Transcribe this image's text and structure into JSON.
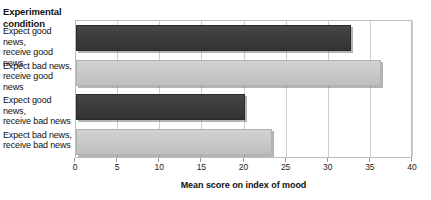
{
  "axis_group_title": "Experimental\ncondition",
  "chart_data": {
    "type": "bar",
    "orientation": "horizontal",
    "title": "",
    "subtitle": "",
    "xlabel": "Mean score on index of mood",
    "ylabel": "Experimental condition",
    "xlim": [
      0,
      40
    ],
    "xticks": [
      0,
      5,
      10,
      15,
      20,
      25,
      30,
      35,
      40
    ],
    "xtick_labels": [
      "0",
      "5",
      "10",
      "15",
      "20",
      "25",
      "30",
      "35",
      "40"
    ],
    "grid": "vertical",
    "legend": "none",
    "categories": [
      "Expect good news, receive good news",
      "Expect bad news, receive good news",
      "Expect good news, receive bad news",
      "Expect bad news, receive bad news"
    ],
    "category_lines": [
      [
        "Expect good news,",
        "receive good news"
      ],
      [
        "Expect bad news,",
        "receive good news"
      ],
      [
        "Expect good news,",
        "receive bad news"
      ],
      [
        "Expect bad news,",
        "receive bad news"
      ]
    ],
    "values": [
      32.6,
      36.2,
      20.1,
      23.3
    ],
    "bar_colors": [
      "#3b3b3b",
      "#c9c9c9",
      "#3b3b3b",
      "#c9c9c9"
    ],
    "colors": {
      "dark_bar": "#3b3b3b",
      "light_bar": "#c9c9c9",
      "gridline": "#cfcfcf",
      "plot_border": "#bdbdbd",
      "text": "#111111",
      "background": "#ffffff"
    }
  }
}
